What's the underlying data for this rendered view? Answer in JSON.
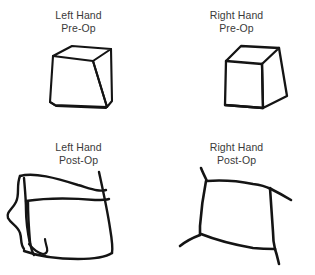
{
  "figure": {
    "background_color": "#ffffff",
    "ink_color": "#141414",
    "text_color": "#3a3a3a",
    "width": 315,
    "height": 275
  },
  "panels": [
    {
      "id": "left-hand-pre-op",
      "caption_line1": "Left Hand",
      "caption_line2": "Pre-Op",
      "hand": "Left",
      "timepoint": "Pre-Op",
      "drawing": "cube"
    },
    {
      "id": "right-hand-pre-op",
      "caption_line1": "Right Hand",
      "caption_line2": "Pre-Op",
      "hand": "Right",
      "timepoint": "Pre-Op",
      "drawing": "cube"
    },
    {
      "id": "left-hand-post-op",
      "caption_line1": "Left Hand",
      "caption_line2": "Post-Op",
      "hand": "Left",
      "timepoint": "Post-Op",
      "drawing": "distorted-square"
    },
    {
      "id": "right-hand-post-op",
      "caption_line1": "Right Hand",
      "caption_line2": "Post-Op",
      "hand": "Right",
      "timepoint": "Post-Op",
      "drawing": "square-with-overshoot"
    }
  ]
}
